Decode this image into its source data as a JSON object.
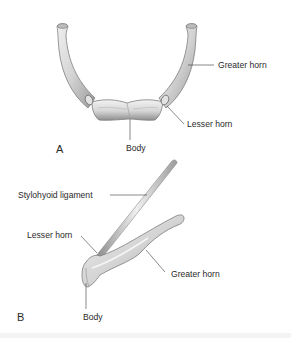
{
  "figure": {
    "panels": [
      {
        "letter": "A",
        "view": "anterior",
        "labels": {
          "greater_horn": "Greater horn",
          "lesser_horn": "Lesser horn",
          "body": "Body"
        }
      },
      {
        "letter": "B",
        "view": "lateral",
        "labels": {
          "stylohyoid_ligament": "Stylohyoid ligament",
          "lesser_horn": "Lesser horn",
          "greater_horn": "Greater horn",
          "body": "Body"
        }
      }
    ],
    "colors": {
      "bone_fill": "#d9d9d9",
      "bone_shadow": "#8f8f8f",
      "bone_highlight": "#f2f2f2",
      "leader_line": "#3a3a3a",
      "text": "#2a2a2a"
    }
  }
}
